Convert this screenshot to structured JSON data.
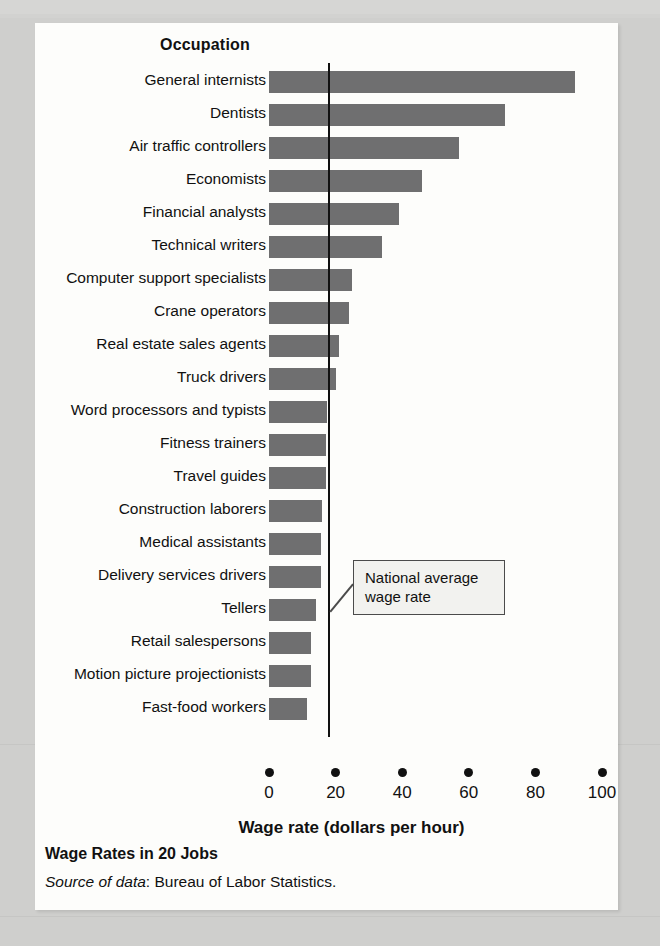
{
  "figure": {
    "column_header": "Occupation",
    "caption_title": "Wage Rates in 20 Jobs",
    "source_label": "Source of data",
    "source_text": ": Bureau of Labor Statistics.",
    "callout_line1": "National average",
    "callout_line2": "wage rate"
  },
  "colors": {
    "bar": "#6f6f70",
    "axis": "#111111",
    "panel": "#fdfdfb",
    "page": "#cfcfcd",
    "callout_fill": "#f2f2ef",
    "callout_border": "#4b4b4b"
  },
  "chart_data": {
    "type": "bar",
    "orientation": "horizontal",
    "title": "Wage Rates in 20 Jobs",
    "xlabel": "Wage rate (dollars per hour)",
    "ylabel": "Occupation",
    "xlim": [
      0,
      100
    ],
    "xticks": [
      0,
      20,
      40,
      60,
      80,
      100
    ],
    "xticklabels": [
      "0",
      "20",
      "40",
      "60",
      "80",
      "100"
    ],
    "grid": false,
    "legend": null,
    "annotations": [
      {
        "text": "National average wage rate",
        "type": "reference-line-callout",
        "value": 18
      }
    ],
    "reference_line": {
      "label": "National average wage rate",
      "value": 18
    },
    "categories": [
      "General internists",
      "Dentists",
      "Air traffic controllers",
      "Economists",
      "Financial analysts",
      "Technical writers",
      "Computer support specialists",
      "Crane operators",
      "Real estate sales agents",
      "Truck drivers",
      "Word processors and typists",
      "Fitness trainers",
      "Travel guides",
      "Construction laborers",
      "Medical assistants",
      "Delivery services drivers",
      "Tellers",
      "Retail salespersons",
      "Motion picture projectionists",
      "Fast-food workers"
    ],
    "values": [
      92,
      71,
      57,
      46,
      39,
      34,
      25,
      24,
      21,
      20,
      17.5,
      17,
      17,
      16,
      15.5,
      15.5,
      14,
      12.5,
      12.5,
      11.5
    ],
    "units": "dollars per hour"
  }
}
